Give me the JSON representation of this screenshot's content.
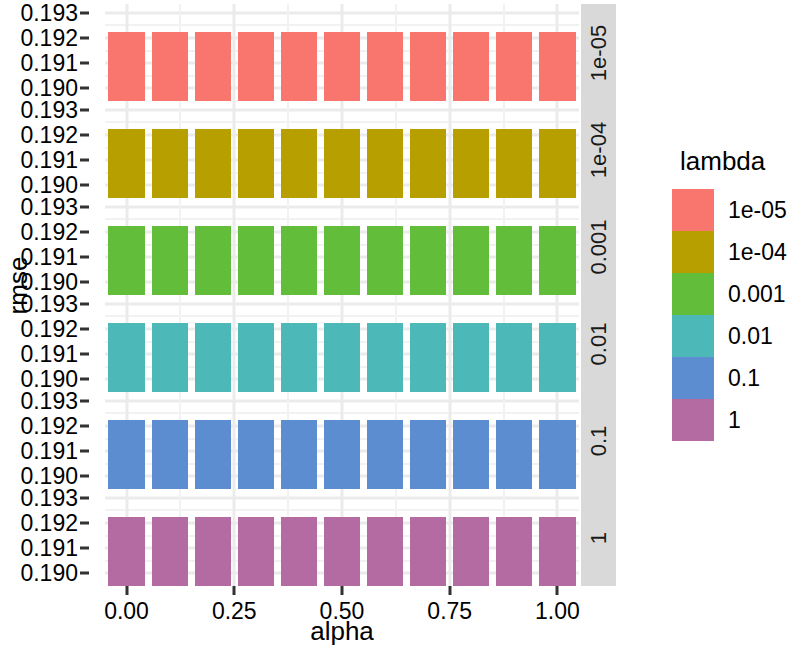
{
  "chart_data": {
    "type": "bar",
    "title": "",
    "xlabel": "alpha",
    "ylabel": "rmse",
    "facet_variable": "lambda",
    "legend_title": "lambda",
    "legend_position": "right",
    "grid": true,
    "xlim": [
      -0.05,
      1.05
    ],
    "ylim": [
      0.1895,
      0.19335
    ],
    "x_ticks": [
      "0.00",
      "0.25",
      "0.50",
      "0.75",
      "1.00"
    ],
    "x_tick_values": [
      0.0,
      0.25,
      0.5,
      0.75,
      1.0
    ],
    "y_ticks": [
      "0.193",
      "0.192",
      "0.191",
      "0.190"
    ],
    "y_tick_values": [
      0.193,
      0.192,
      0.191,
      0.19
    ],
    "x": [
      0.0,
      0.1,
      0.2,
      0.3,
      0.4,
      0.5,
      0.6,
      0.7,
      0.8,
      0.9,
      1.0
    ],
    "facets": [
      {
        "label": "1e-05",
        "color": "#F8766D",
        "values": [
          0.19222,
          0.19222,
          0.19222,
          0.19222,
          0.19222,
          0.19222,
          0.19222,
          0.19222,
          0.19222,
          0.19222,
          0.19222
        ]
      },
      {
        "label": "1e-04",
        "color": "#B79F00",
        "values": [
          0.19222,
          0.19222,
          0.19222,
          0.19222,
          0.19222,
          0.19222,
          0.19222,
          0.19222,
          0.19222,
          0.19222,
          0.19222
        ]
      },
      {
        "label": "0.001",
        "color": "#62BE3A",
        "values": [
          0.19222,
          0.19222,
          0.19222,
          0.19222,
          0.19222,
          0.19222,
          0.19222,
          0.19222,
          0.19222,
          0.19222,
          0.19222
        ]
      },
      {
        "label": "0.01",
        "color": "#4CB8B8",
        "values": [
          0.19222,
          0.19222,
          0.19222,
          0.19222,
          0.19222,
          0.19222,
          0.19222,
          0.19222,
          0.19222,
          0.19222,
          0.19222
        ]
      },
      {
        "label": "0.1",
        "color": "#5B8DD0",
        "values": [
          0.19222,
          0.19222,
          0.19222,
          0.19222,
          0.19222,
          0.19222,
          0.19222,
          0.19222,
          0.19222,
          0.19222,
          0.19222
        ]
      },
      {
        "label": "1",
        "color": "#B36BA1",
        "values": [
          0.19222,
          0.19222,
          0.19222,
          0.19222,
          0.19222,
          0.19222,
          0.19222,
          0.19222,
          0.19222,
          0.19222,
          0.19222
        ]
      }
    ],
    "legend_entries": [
      {
        "label": "1e-05",
        "color": "#F8766D"
      },
      {
        "label": "1e-04",
        "color": "#B79F00"
      },
      {
        "label": "0.001",
        "color": "#62BE3A"
      },
      {
        "label": "0.01",
        "color": "#4CB8B8"
      },
      {
        "label": "0.1",
        "color": "#5B8DD0"
      },
      {
        "label": "1",
        "color": "#B36BA1"
      }
    ]
  },
  "axes": {
    "x_title": "alpha",
    "y_title": "rmse"
  },
  "legend": {
    "title": "lambda"
  },
  "theme": {
    "panel_background": "#ffffff",
    "grid_major": "#ebebeb",
    "grid_minor": "#f2f2f2",
    "strip_background": "#d9d9d9",
    "text_color": "#000000"
  }
}
